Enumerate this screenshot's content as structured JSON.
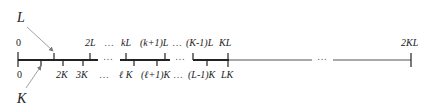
{
  "diagram": {
    "pointer_labels": {
      "L": "L",
      "K": "K"
    },
    "top_labels": [
      {
        "text": "0",
        "x": 16
      },
      {
        "text": "2L",
        "x": 86
      },
      {
        "text": "…",
        "x": 104
      },
      {
        "text": "kL",
        "x": 121
      },
      {
        "text": "(k+1)L",
        "x": 139
      },
      {
        "text": "…",
        "x": 172
      },
      {
        "text": "(K-1)L",
        "x": 187
      },
      {
        "text": "KL",
        "x": 219
      },
      {
        "text": "2KL",
        "x": 402
      }
    ],
    "bottom_labels": [
      {
        "text": "0",
        "x": 17
      },
      {
        "text": "2K",
        "x": 56
      },
      {
        "text": "3K",
        "x": 77
      },
      {
        "text": "…",
        "x": 99
      },
      {
        "text": "ℓ K",
        "x": 119
      },
      {
        "text": "(ℓ+1)K",
        "x": 141
      },
      {
        "text": "…",
        "x": 173
      },
      {
        "text": "(L-1)K",
        "x": 188
      },
      {
        "text": "LK",
        "x": 221
      }
    ],
    "middle_dots": [
      "…",
      "…",
      "…"
    ],
    "colors": {
      "line": "#222222",
      "thin_line": "#555555",
      "arrow": "#888888"
    }
  }
}
